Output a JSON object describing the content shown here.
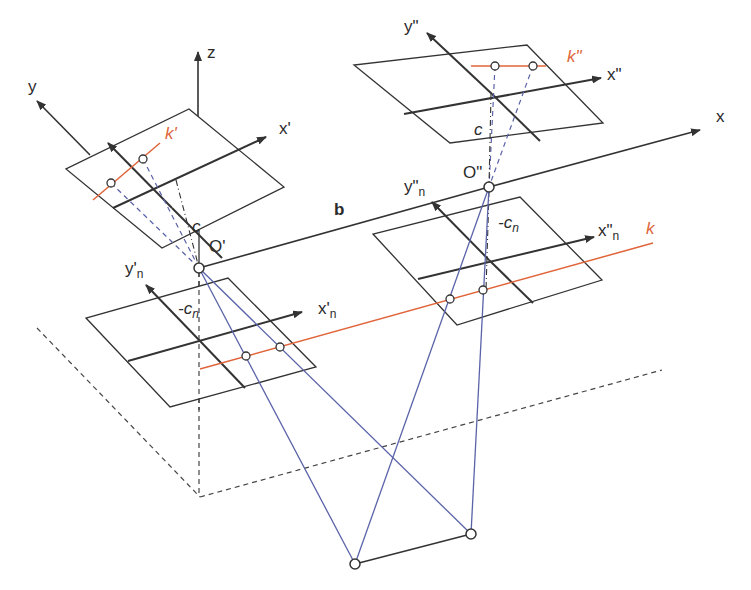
{
  "colors": {
    "axis": "#333333",
    "ray": "#5a63a8",
    "epipolar": "#e0643a",
    "dashed": "#444444",
    "background": "#ffffff"
  },
  "labels": {
    "z": "z",
    "y": "y",
    "x": "x",
    "x_prime": "x'",
    "k_prime": "k'",
    "c_left": "c",
    "o_prime": "O'",
    "y_n_prime": "y'",
    "y_n_prime_sub": "n",
    "minus_cn_left": "-c",
    "minus_cn_left_sub": "n",
    "x_n_prime": "x'",
    "x_n_prime_sub": "n",
    "b": "b",
    "y_double": "y\"",
    "k_double": "k\"",
    "x_double": "x\"",
    "c_right": "c",
    "o_double": "O\"",
    "y_n_double": "y\"",
    "y_n_double_sub": "n",
    "minus_cn_right": "-c",
    "minus_cn_right_sub": "n",
    "x_n_double": "x\"",
    "x_n_double_sub": "n",
    "k": "k"
  },
  "geometry": {
    "projection_centers": {
      "O_prime": [
        199,
        268
      ],
      "O_double": [
        489,
        187
      ]
    },
    "object_points": [
      [
        355,
        564
      ],
      [
        471,
        534
      ]
    ],
    "image_planes": [
      {
        "name": "left-positive",
        "corners": [
          [
            189,
            109
          ],
          [
            284,
            187
          ],
          [
            162,
            248
          ],
          [
            66,
            169
          ]
        ]
      },
      {
        "name": "left-negative",
        "corners": [
          [
            228,
            278
          ],
          [
            316,
            367
          ],
          [
            170,
            407
          ],
          [
            86,
            318
          ]
        ]
      },
      {
        "name": "right-positive",
        "corners": [
          [
            527,
            45
          ],
          [
            603,
            123
          ],
          [
            450,
            143
          ],
          [
            354,
            65
          ]
        ]
      },
      {
        "name": "right-negative",
        "corners": [
          [
            520,
            197
          ],
          [
            602,
            280
          ],
          [
            457,
            325
          ],
          [
            373,
            234
          ]
        ]
      }
    ]
  }
}
